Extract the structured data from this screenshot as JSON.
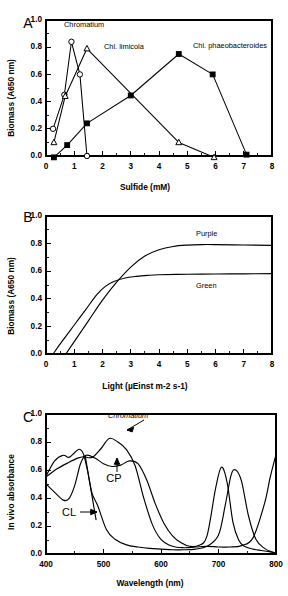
{
  "figure": {
    "panels": [
      "A",
      "B",
      "C"
    ]
  },
  "panel_a": {
    "letter": "A",
    "xlabel": "Sulfide (mM)",
    "ylabel": "Biomass (A650 nm)",
    "xticks": [
      "0",
      "1",
      "2",
      "3",
      "4",
      "5",
      "6",
      "7",
      "8"
    ],
    "yticks": [
      "0.0",
      "0.2",
      "0.4",
      "0.6",
      "0.8",
      "1.0"
    ],
    "annotations": {
      "chromatium": "Chromatium",
      "limicola": "Chl. limicola",
      "phaeobacteroides": "Chl. phaeobacteroides"
    }
  },
  "panel_b": {
    "letter": "B",
    "xlabel": "Light (µEinst m-2 s-1)",
    "ylabel": "Biomass (A650 nm)",
    "xticks": [
      "0",
      "1",
      "2",
      "3",
      "4",
      "5",
      "6",
      "7",
      "8"
    ],
    "yticks": [
      "0.0",
      "0.2",
      "0.4",
      "0.6",
      "0.8",
      "1.0"
    ],
    "annotations": {
      "purple": "Purple",
      "green": "Green"
    }
  },
  "panel_c": {
    "letter": "C",
    "xlabel": "Wavelength (nm)",
    "ylabel": "In vivo absorbance",
    "xticks": [
      "400",
      "500",
      "600",
      "700",
      "800"
    ],
    "yticks": [
      "0.0",
      "0.2",
      "0.4",
      "0.6",
      "0.8",
      "1.0"
    ],
    "annotations": {
      "chromatium": "Chromatium",
      "cp": "CP",
      "cl": "CL"
    }
  },
  "chart_data": [
    {
      "type": "line",
      "panel": "A",
      "title": "",
      "xlabel": "Sulfide (mM)",
      "ylabel": "Biomass (A650 nm)",
      "xlim": [
        0,
        8
      ],
      "ylim": [
        0.0,
        1.0
      ],
      "xticks": [
        0,
        1,
        2,
        3,
        4,
        5,
        6,
        7,
        8
      ],
      "yticks": [
        0.0,
        0.2,
        0.4,
        0.6,
        0.8,
        1.0
      ],
      "grid": false,
      "legend": "inline-annotations",
      "series": [
        {
          "name": "Chromatium",
          "marker": "open-circle",
          "x": [
            0.25,
            0.65,
            0.9,
            1.2,
            1.45
          ],
          "y": [
            0.2,
            0.45,
            0.84,
            0.6,
            0.0
          ]
        },
        {
          "name": "Chl. limicola",
          "marker": "open-triangle",
          "x": [
            0.28,
            0.68,
            1.45,
            4.7,
            5.95
          ],
          "y": [
            0.1,
            0.44,
            0.79,
            0.1,
            -0.01
          ]
        },
        {
          "name": "Chl. phaeobacteroides",
          "marker": "filled-square",
          "x": [
            0.28,
            0.75,
            1.45,
            3.0,
            4.7,
            5.9,
            7.1
          ],
          "y": [
            -0.01,
            0.08,
            0.24,
            0.445,
            0.75,
            0.6,
            0.01
          ]
        }
      ]
    },
    {
      "type": "line",
      "panel": "B",
      "title": "",
      "xlabel": "Light (µEinst m-2 s-1)",
      "ylabel": "Biomass (A650 nm)",
      "xlim": [
        0,
        8
      ],
      "ylim": [
        0.0,
        1.0
      ],
      "xticks": [
        0,
        1,
        2,
        3,
        4,
        5,
        6,
        7,
        8
      ],
      "yticks": [
        0.0,
        0.2,
        0.4,
        0.6,
        0.8,
        1.0
      ],
      "grid": false,
      "legend": "inline-annotations",
      "series": [
        {
          "name": "Purple",
          "marker": "none",
          "x": [
            0.7,
            1.0,
            1.5,
            2.0,
            2.5,
            3.0,
            3.5,
            4.0,
            4.5,
            5.0,
            5.5,
            6.0,
            7.0,
            8.0
          ],
          "y": [
            0.0,
            0.09,
            0.24,
            0.39,
            0.52,
            0.63,
            0.71,
            0.755,
            0.779,
            0.789,
            0.793,
            0.793,
            0.79,
            0.787
          ]
        },
        {
          "name": "Green",
          "marker": "none",
          "x": [
            0.25,
            0.6,
            1.0,
            1.4,
            1.8,
            2.1,
            2.4,
            2.8,
            3.2,
            3.6,
            4.0,
            5.0,
            6.0,
            7.0,
            8.0
          ],
          "y": [
            0.0,
            0.1,
            0.21,
            0.32,
            0.43,
            0.49,
            0.525,
            0.551,
            0.563,
            0.57,
            0.574,
            0.578,
            0.58,
            0.581,
            0.582
          ]
        }
      ]
    },
    {
      "type": "line",
      "panel": "C",
      "title": "",
      "xlabel": "Wavelength (nm)",
      "ylabel": "In vivo absorbance",
      "xlim": [
        400,
        800
      ],
      "ylim": [
        0.0,
        1.0
      ],
      "xticks": [
        400,
        500,
        600,
        700,
        800
      ],
      "yticks": [
        0.0,
        0.2,
        0.4,
        0.6,
        0.8,
        1.0
      ],
      "grid": false,
      "legend": "inline-annotations",
      "series": [
        {
          "name": "Chromatium",
          "marker": "none",
          "x": [
            400,
            420,
            440,
            455,
            465,
            480,
            495,
            510,
            525,
            540,
            555,
            570,
            585,
            600,
            620,
            640,
            660,
            680,
            700,
            720,
            740,
            760,
            780,
            790,
            800
          ],
          "y": [
            0.55,
            0.61,
            0.655,
            0.685,
            0.695,
            0.69,
            0.75,
            0.825,
            0.8,
            0.745,
            0.63,
            0.4,
            0.21,
            0.105,
            0.055,
            0.045,
            0.05,
            0.055,
            0.05,
            0.05,
            0.06,
            0.115,
            0.36,
            0.55,
            0.71
          ]
        },
        {
          "name": "CP",
          "marker": "none",
          "x": [
            400,
            415,
            430,
            440,
            450,
            460,
            470,
            485,
            500,
            515,
            530,
            545,
            560,
            575,
            590,
            605,
            620,
            635,
            650,
            665,
            680,
            695,
            705,
            715,
            725,
            735,
            745,
            760,
            775,
            790,
            800
          ],
          "y": [
            0.5,
            0.44,
            0.385,
            0.395,
            0.49,
            0.645,
            0.705,
            0.685,
            0.645,
            0.625,
            0.635,
            0.665,
            0.645,
            0.53,
            0.36,
            0.22,
            0.13,
            0.08,
            0.055,
            0.06,
            0.13,
            0.47,
            0.62,
            0.51,
            0.23,
            0.1,
            0.055,
            0.035,
            0.025,
            0.015,
            0.005
          ]
        },
        {
          "name": "CL",
          "marker": "none",
          "x": [
            400,
            415,
            430,
            440,
            450,
            458,
            465,
            472,
            480,
            490,
            505,
            520,
            540,
            560,
            580,
            600,
            620,
            640,
            660,
            680,
            700,
            712,
            722,
            730,
            740,
            752,
            765,
            780,
            795,
            800
          ],
          "y": [
            0.555,
            0.665,
            0.705,
            0.69,
            0.725,
            0.748,
            0.715,
            0.6,
            0.435,
            0.345,
            0.175,
            0.105,
            0.065,
            0.05,
            0.04,
            0.035,
            0.03,
            0.03,
            0.035,
            0.055,
            0.135,
            0.355,
            0.565,
            0.6,
            0.52,
            0.275,
            0.105,
            0.04,
            0.012,
            0.008
          ]
        }
      ]
    }
  ]
}
